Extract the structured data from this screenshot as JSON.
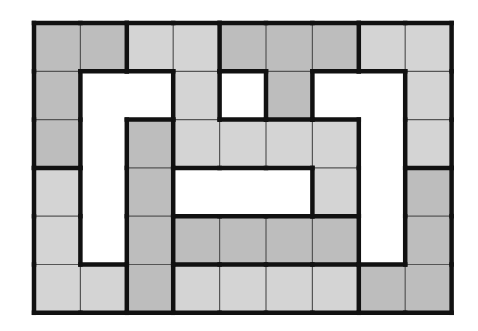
{
  "grid": {
    "cols": 9,
    "rows": 6,
    "x0": 34,
    "y0": 23,
    "cell_w": 46.4,
    "cell_h": 48.3,
    "colors": {
      "D": "#bdbdbd",
      "L": "#d4d4d4",
      "W": "#ffffff",
      "line_thin": "#555555",
      "line_thick": "#111111"
    },
    "cells": [
      [
        "D",
        "D",
        "L",
        "L",
        "D",
        "D",
        "D",
        "L",
        "L"
      ],
      [
        "D",
        "W",
        "W",
        "L",
        "W",
        "D",
        "W",
        "W",
        "L"
      ],
      [
        "D",
        "W",
        "D",
        "L",
        "L",
        "L",
        "L",
        "W",
        "L"
      ],
      [
        "L",
        "W",
        "D",
        "W",
        "W",
        "W",
        "L",
        "W",
        "D"
      ],
      [
        "L",
        "W",
        "D",
        "D",
        "D",
        "D",
        "D",
        "W",
        "D"
      ],
      [
        "L",
        "L",
        "D",
        "L",
        "L",
        "L",
        "L",
        "D",
        "D"
      ]
    ],
    "regions": [
      [
        1,
        1,
        2,
        2,
        3,
        3,
        3,
        4,
        4
      ],
      [
        1,
        0,
        0,
        2,
        0,
        3,
        0,
        0,
        4
      ],
      [
        1,
        0,
        5,
        2,
        2,
        2,
        2,
        0,
        4
      ],
      [
        6,
        0,
        5,
        0,
        0,
        0,
        2,
        0,
        7
      ],
      [
        6,
        0,
        5,
        8,
        8,
        8,
        8,
        0,
        7
      ],
      [
        6,
        6,
        5,
        9,
        9,
        9,
        9,
        7,
        7
      ]
    ]
  }
}
